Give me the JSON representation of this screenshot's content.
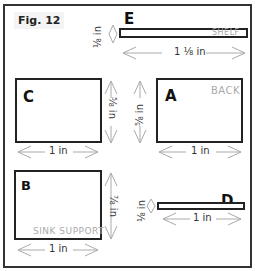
{
  "figure": {
    "label": "Fig. 12"
  },
  "pieces": {
    "E": {
      "letter": "E",
      "name": "SHELF",
      "width": "1 ⅛ in",
      "height": "⅛ in"
    },
    "C": {
      "letter": "C",
      "name": "",
      "width": "1 in",
      "height": "⅝ in"
    },
    "A": {
      "letter": "A",
      "name": "BACK",
      "width": "1 in",
      "height": "⅝ in"
    },
    "B": {
      "letter": "B",
      "name": "SINK SUPPORT",
      "width": "1 in",
      "height": "⅞ in"
    },
    "D": {
      "letter": "D",
      "name": "",
      "width": "1 in",
      "height": "⅛ in"
    }
  }
}
